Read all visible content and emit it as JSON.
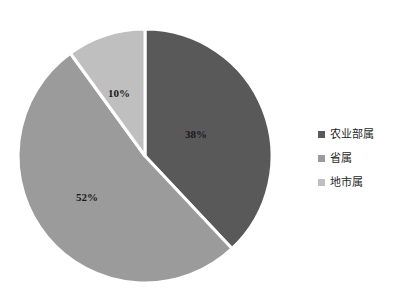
{
  "chart_data": {
    "type": "pie",
    "title": "",
    "categories": [
      "农业部属",
      "省属",
      "地市属"
    ],
    "values": [
      38,
      52,
      10
    ],
    "labels": [
      "38%",
      "52%",
      "10%"
    ],
    "colors": [
      "#595959",
      "#9b9b9b",
      "#bfbfbf"
    ],
    "units": "%",
    "start_angle_deg": 0,
    "direction": "clockwise",
    "legend_position": "right",
    "grid": false,
    "slices": [
      {
        "name": "农业部属",
        "value": 38,
        "label": "38%",
        "color": "#595959"
      },
      {
        "name": "省属",
        "value": 52,
        "label": "52%",
        "color": "#9b9b9b"
      },
      {
        "name": "地市属",
        "value": 10,
        "label": "10%",
        "color": "#bfbfbf"
      }
    ]
  },
  "legend": {
    "items": [
      {
        "label": "农业部属",
        "color": "#595959",
        "marker": "square-marker"
      },
      {
        "label": "省属",
        "color": "#9b9b9b",
        "marker": "square-marker"
      },
      {
        "label": "地市属",
        "color": "#bfbfbf",
        "marker": "square-marker"
      }
    ]
  },
  "style": {
    "background": "#ffffff",
    "divider_color": "#ffffff",
    "label_color": "#1a1a1a"
  }
}
